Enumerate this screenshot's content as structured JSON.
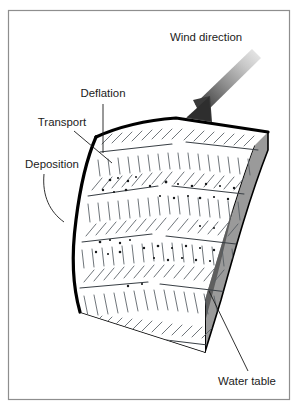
{
  "figure": {
    "type": "block-diagram",
    "background_color": "#ffffff",
    "frame": {
      "name": "figure-border",
      "stroke_color": "#8e8e8e",
      "x": 8,
      "y": 10,
      "width": 282,
      "height": 390
    },
    "labels": [
      {
        "id": "wind-direction",
        "text": "Wind direction",
        "x": 206,
        "y": 38,
        "anchor": "middle",
        "color": "#1b1b1b"
      },
      {
        "id": "deflation",
        "text": "Deflation",
        "x": 103,
        "y": 94,
        "anchor": "middle",
        "color": "#1b1b1b"
      },
      {
        "id": "transport",
        "text": "Transport",
        "x": 62,
        "y": 123,
        "anchor": "middle",
        "color": "#1b1b1b"
      },
      {
        "id": "deposition",
        "text": "Deposition",
        "x": 52,
        "y": 165,
        "anchor": "middle",
        "color": "#1b1b1b"
      },
      {
        "id": "water-table",
        "text": "Water table",
        "x": 247,
        "y": 382,
        "anchor": "middle",
        "color": "#1b1b1b"
      }
    ],
    "arrow": {
      "id": "wind-direction-arrow",
      "direction": "down-left",
      "gradient_from": "#e9e9e9",
      "gradient_to": "#3a3a3a",
      "tail_x": 246,
      "tail_y": 50,
      "tip_x": 186,
      "tip_y": 117
    },
    "block": {
      "top_surface_color": "#ffffff",
      "outline_color": "#000000",
      "right_face_color": "#9a9a9a",
      "right_face_shadow_color": "#5f5f5f",
      "front_face_color": "#8f8f8f",
      "sand_band_color": "#ffffff",
      "ripple_stroke_color": "#555c62",
      "band_line_color": "#3a4046",
      "grain_dot_color": "#17191b"
    },
    "ripple_bands": [
      {
        "id": "band-1",
        "y_left": 236,
        "y_right": 130
      },
      {
        "id": "band-2",
        "y_left": 268,
        "y_right": 162
      },
      {
        "id": "band-3",
        "y_left": 300,
        "y_right": 194
      },
      {
        "id": "band-4",
        "y_left": 332,
        "y_right": 226
      }
    ],
    "annotation_meaning": {
      "deflation": "wind removal of sand from the windward surface",
      "transport": "sand carried downwind by saltation",
      "deposition": "sand accumulating on the slip face",
      "water_table": "saturated zone at the base of the dune field"
    }
  }
}
